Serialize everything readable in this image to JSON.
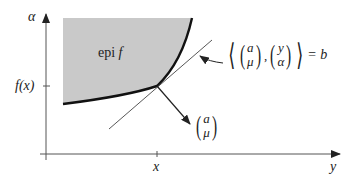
{
  "diagram": {
    "axes": {
      "vertical_label": "α",
      "horizontal_label": "y",
      "tick_x_label": "x",
      "tick_y_label": "f(x)"
    },
    "region_label": {
      "prefix": "epi",
      "func": "f"
    },
    "normal_vector": {
      "top": "a",
      "bottom": "μ"
    },
    "hyperplane_equation": {
      "left_vec": {
        "top": "a",
        "bottom": "μ"
      },
      "right_vec": {
        "top": "y",
        "bottom": "α"
      },
      "separator": ",",
      "rhs": "= b"
    },
    "colors": {
      "region_fill": "#c9c9c9",
      "boundary": "#111111",
      "lines": "#333333"
    }
  }
}
